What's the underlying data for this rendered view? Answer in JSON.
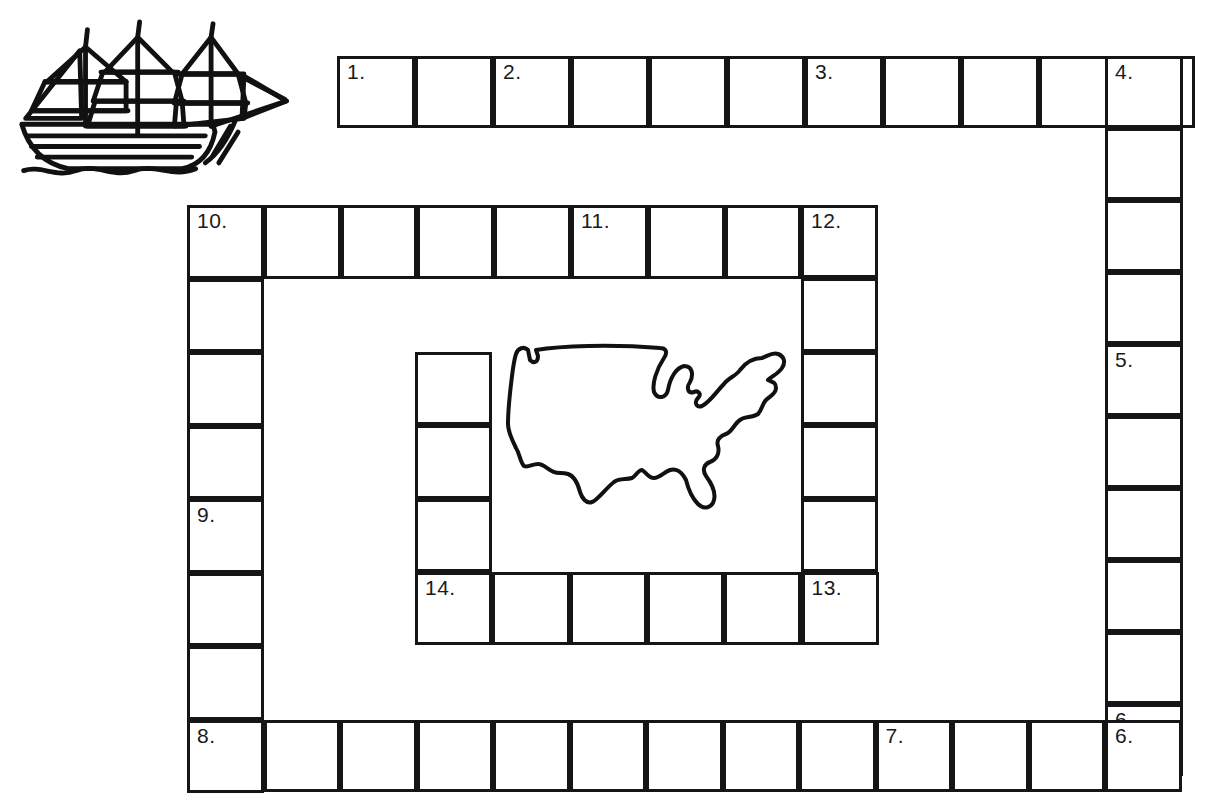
{
  "page": {
    "background_color": "#ffffff",
    "ink_color": "#151515",
    "width": 1206,
    "height": 804
  },
  "artwork": [
    {
      "name": "sailing-ship-illustration",
      "label": "three-masted sailing ship clipart",
      "x": 12,
      "y": 18,
      "width": 290,
      "height": 170
    },
    {
      "name": "united-states-map-outline",
      "label": "outline map of the continental United States",
      "x": 500,
      "y": 336,
      "width": 300,
      "height": 176
    }
  ],
  "puzzle": {
    "type": "crossword",
    "shape": "nested rectangular rings",
    "clue_numbers": [
      "1.",
      "2.",
      "3.",
      "4.",
      "5.",
      "6.",
      "7.",
      "8.",
      "9.",
      "10.",
      "11.",
      "12.",
      "13.",
      "14."
    ],
    "bands": [
      {
        "name": "top-row",
        "orientation": "horizontal",
        "x": 337,
        "y": 56,
        "cell_w": 78,
        "cell_h": 72,
        "count": 11,
        "numbers": {
          "0": "1.",
          "2": "2.",
          "6": "3.",
          "10": "4."
        }
      },
      {
        "name": "right-column",
        "orientation": "vertical",
        "x": 1105,
        "y": 56,
        "cell_w": 78,
        "cell_h": 72,
        "count": 10,
        "numbers": {
          "0": "4.",
          "4": "5.",
          "9": "6."
        }
      },
      {
        "name": "bottom-row",
        "orientation": "horizontal",
        "x": 187,
        "y": 720,
        "cell_w": 76.5,
        "cell_h": 72,
        "count": 13,
        "numbers": {
          "0": "8.",
          "9": "7.",
          "12": "6."
        }
      },
      {
        "name": "left-column",
        "orientation": "vertical",
        "x": 187,
        "y": 205,
        "cell_w": 76.5,
        "cell_h": 73.5,
        "count": 8,
        "numbers": {
          "0": "10.",
          "4": "9.",
          "7": "8."
        }
      },
      {
        "name": "middle-top-row",
        "orientation": "horizontal",
        "x": 187,
        "y": 205,
        "cell_w": 76.8,
        "cell_h": 73.5,
        "count": 9,
        "numbers": {
          "0": "10.",
          "5": "11.",
          "8": "12."
        }
      },
      {
        "name": "middle-right-column",
        "orientation": "vertical",
        "x": 801,
        "y": 205,
        "cell_w": 76.8,
        "cell_h": 73.4,
        "count": 6,
        "numbers": {
          "0": "12.",
          "5": "13."
        }
      },
      {
        "name": "middle-bottom-row",
        "orientation": "horizontal",
        "x": 415,
        "y": 572,
        "cell_w": 77.3,
        "cell_h": 73.4,
        "count": 6,
        "numbers": {
          "0": "14.",
          "5": "13."
        }
      },
      {
        "name": "inner-left-column",
        "orientation": "vertical",
        "x": 415,
        "y": 352,
        "cell_w": 77.3,
        "cell_h": 73.3,
        "count": 4,
        "numbers": {
          "3": "14."
        }
      }
    ]
  }
}
